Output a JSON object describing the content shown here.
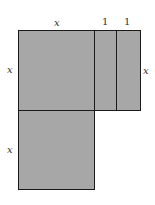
{
  "diagram": {
    "fill_color": "#a7a7a7",
    "stroke_color": "#1a1a1a",
    "labels": {
      "top_x": "x",
      "top_one_a": "1",
      "top_one_b": "1",
      "left_x_upper": "x",
      "right_x": "x",
      "left_x_lower": "x"
    },
    "regions": [
      {
        "name": "x-squared-top",
        "width": "x",
        "height": "x"
      },
      {
        "name": "strip-1",
        "width": "1",
        "height": "x"
      },
      {
        "name": "strip-2",
        "width": "1",
        "height": "x"
      },
      {
        "name": "x-squared-bottom",
        "width": "x",
        "height": "x"
      }
    ]
  }
}
